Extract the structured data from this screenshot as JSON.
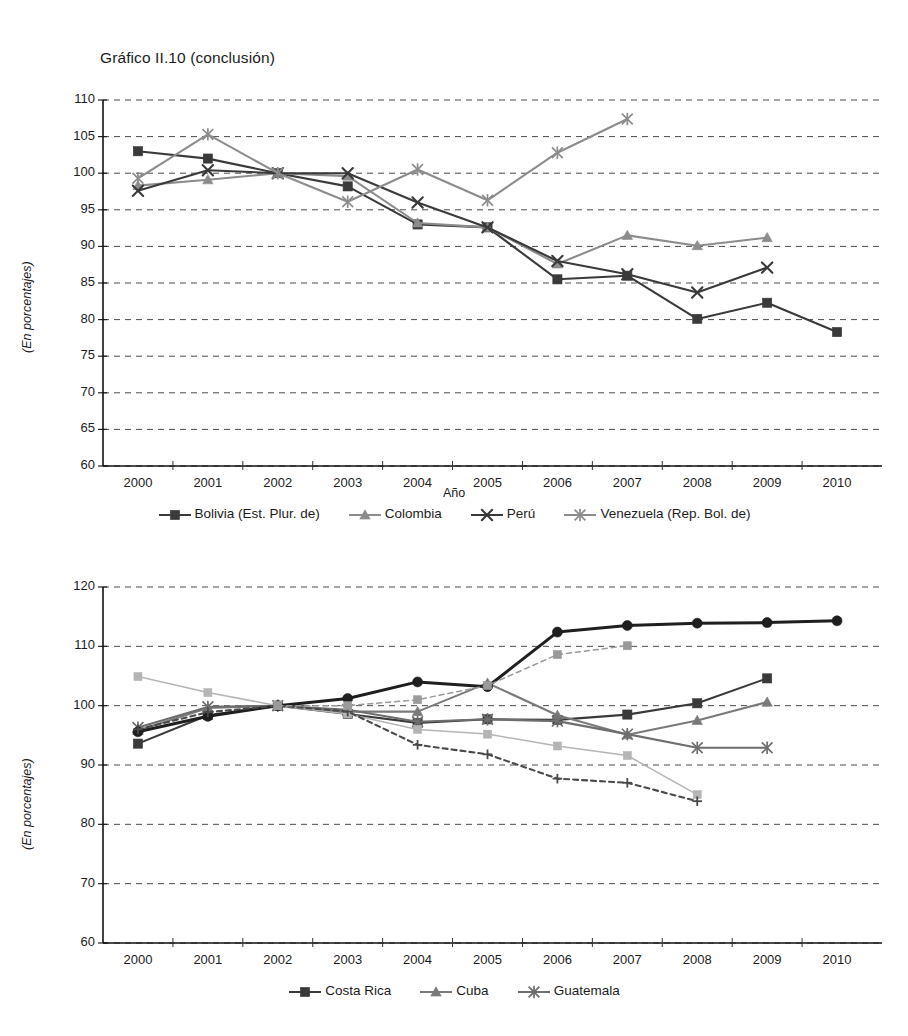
{
  "title": "Gráfico II.10 (conclusión)",
  "charts": [
    {
      "id": "top",
      "axis": {
        "ylabel": "(En porcentajes)",
        "xlabel": "Año",
        "ylim": [
          60,
          110
        ],
        "yticks": [
          60,
          65,
          70,
          75,
          80,
          85,
          90,
          95,
          100,
          105,
          110
        ],
        "grid": true,
        "legend_position": "bottom"
      },
      "chart_data": {
        "type": "line",
        "title": "Gráfico II.10 (conclusión)",
        "xlabel": "Año",
        "ylabel": "(En porcentajes)",
        "ylim": [
          60,
          110
        ],
        "yticks": [
          60,
          65,
          70,
          75,
          80,
          85,
          90,
          95,
          100,
          105,
          110
        ],
        "categories": [
          "2000",
          "2001",
          "2002",
          "2003",
          "2004",
          "2005",
          "2006",
          "2007",
          "2008",
          "2009",
          "2010"
        ],
        "series": [
          {
            "name": "Bolivia (Est. Plur. de)",
            "marker": "square",
            "color": "#3a3a3a",
            "values": [
              103.0,
              102.0,
              100.0,
              98.2,
              93.0,
              92.6,
              85.5,
              86.0,
              80.1,
              82.3,
              78.3
            ]
          },
          {
            "name": "Colombia",
            "marker": "triangle",
            "color": "#8c8c8c",
            "values": [
              98.3,
              99.1,
              100.0,
              99.6,
              93.2,
              92.6,
              87.6,
              91.5,
              90.1,
              91.2,
              null
            ]
          },
          {
            "name": "Perú",
            "marker": "x",
            "color": "#3a3a3a",
            "values": [
              97.6,
              100.4,
              100.0,
              100.0,
              96.0,
              92.6,
              88.0,
              86.2,
              83.7,
              87.1,
              null
            ]
          },
          {
            "name": "Venezuela (Rep. Bol. de)",
            "marker": "asterisk",
            "color": "#8c8c8c",
            "values": [
              99.3,
              105.3,
              100.0,
              96.1,
              100.5,
              96.3,
              102.8,
              107.4,
              null,
              null,
              null
            ]
          }
        ]
      },
      "legend": [
        {
          "label": "Bolivia (Est. Plur. de)",
          "marker": "square",
          "color": "#3a3a3a"
        },
        {
          "label": "Colombia",
          "marker": "triangle",
          "color": "#8c8c8c"
        },
        {
          "label": "Perú",
          "marker": "x",
          "color": "#3a3a3a"
        },
        {
          "label": "Venezuela (Rep. Bol. de)",
          "marker": "asterisk",
          "color": "#8c8c8c"
        }
      ]
    },
    {
      "id": "bottom",
      "axis": {
        "ylabel": "(En porcentajes)",
        "xlabel": "",
        "ylim": [
          60,
          120
        ],
        "yticks": [
          60,
          70,
          80,
          90,
          100,
          110,
          120
        ],
        "grid": true,
        "legend_position": "bottom"
      },
      "chart_data": {
        "type": "line",
        "title": "",
        "xlabel": "",
        "ylabel": "(En porcentajes)",
        "ylim": [
          60,
          120
        ],
        "yticks": [
          60,
          70,
          80,
          90,
          100,
          110,
          120
        ],
        "categories": [
          "2000",
          "2001",
          "2002",
          "2003",
          "2004",
          "2005",
          "2006",
          "2007",
          "2008",
          "2009",
          "2010"
        ],
        "series": [
          {
            "name": "Costa Rica",
            "marker": "square",
            "color": "#3a3a3a",
            "values": [
              93.6,
              98.4,
              100.0,
              98.6,
              97.1,
              97.7,
              97.6,
              98.5,
              100.4,
              104.6,
              null
            ]
          },
          {
            "name": "Cuba",
            "marker": "triangle",
            "color": "#7a7a7a",
            "values": [
              95.8,
              99.6,
              100.0,
              99.0,
              99.0,
              103.8,
              98.4,
              95.1,
              97.5,
              100.6,
              null
            ]
          },
          {
            "name": "Guatemala",
            "marker": "asterisk",
            "color": "#6e6e6e",
            "values": [
              96.3,
              99.8,
              100.0,
              99.3,
              97.3,
              97.7,
              97.4,
              95.2,
              92.9,
              92.9,
              null
            ]
          },
          {
            "name": "serie-circulo",
            "marker": "circle",
            "color": "#1f1f1f",
            "values": [
              95.6,
              98.2,
              100.0,
              101.2,
              104.0,
              103.2,
              112.4,
              113.5,
              113.9,
              114.0,
              114.3
            ]
          },
          {
            "name": "serie-cuadro-claro",
            "marker": "square-light",
            "color": "#b5b5b5",
            "values": [
              104.9,
              102.2,
              100.0,
              98.6,
              96.0,
              95.2,
              93.2,
              91.6,
              85.0,
              null,
              null
            ]
          },
          {
            "name": "serie-cruz-punteada",
            "marker": "plus",
            "color": "#4a4a4a",
            "style": "dashed",
            "values": [
              96.0,
              98.9,
              100.0,
              99.0,
              93.4,
              91.8,
              87.7,
              87.0,
              83.9,
              null,
              null
            ]
          },
          {
            "name": "serie-cuadro-punteada",
            "marker": "square-mid",
            "color": "#9a9a9a",
            "style": "dashed",
            "values": [
              null,
              null,
              100.0,
              100.0,
              101.0,
              103.4,
              108.6,
              110.1,
              null,
              null,
              null
            ]
          }
        ]
      },
      "legend": [
        {
          "label": "Costa Rica",
          "marker": "square",
          "color": "#3a3a3a"
        },
        {
          "label": "Cuba",
          "marker": "triangle",
          "color": "#7a7a7a"
        },
        {
          "label": "Guatemala",
          "marker": "asterisk",
          "color": "#6e6e6e"
        }
      ]
    }
  ]
}
